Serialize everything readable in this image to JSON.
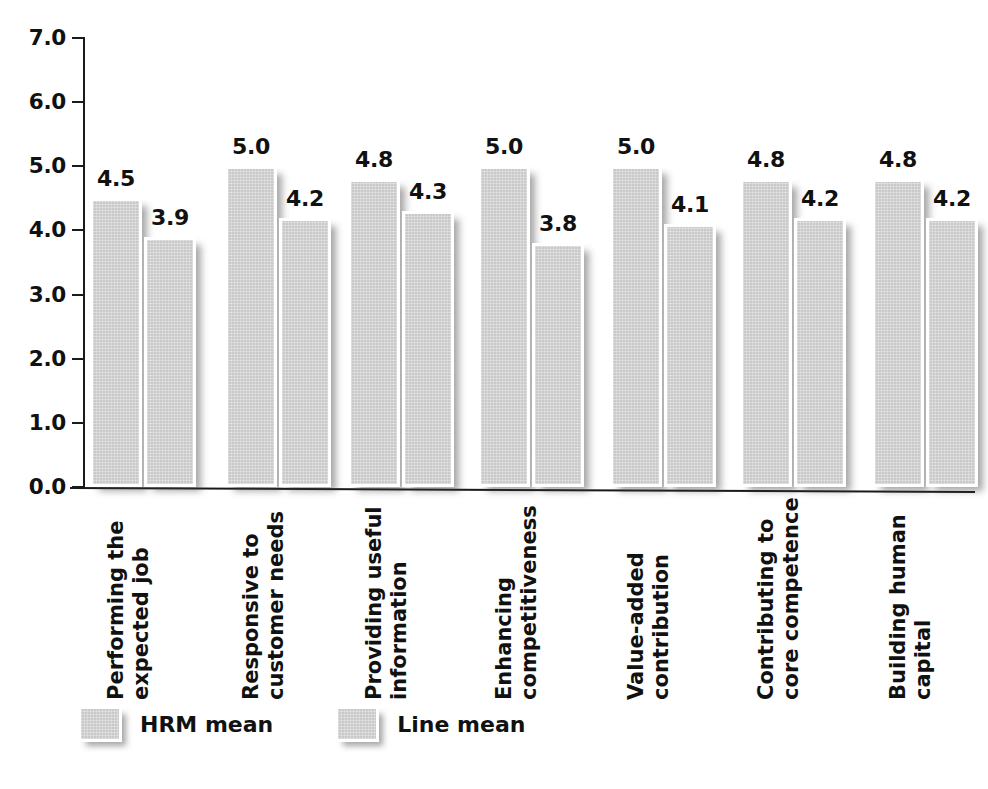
{
  "chart_data": {
    "type": "bar",
    "title": "",
    "subtitle": "",
    "xlabel": "",
    "ylabel": "",
    "ylim": [
      0.0,
      7.0
    ],
    "y_ticks": [
      "0.0",
      "1.0",
      "2.0",
      "3.0",
      "4.0",
      "5.0",
      "6.0",
      "7.0"
    ],
    "grid": false,
    "legend_position": "bottom-left",
    "categories": [
      "Performing the expected job",
      "Responsive to customer needs",
      "Providing useful information",
      "Enhancing competitiveness",
      "Value-added contribution",
      "Contributing to core competence",
      "Building human capital"
    ],
    "category_lines": [
      [
        "Performing the",
        "expected job"
      ],
      [
        "Responsive to",
        "customer needs"
      ],
      [
        "Providing useful",
        "information"
      ],
      [
        "Enhancing",
        "competitiveness"
      ],
      [
        "Value-added",
        "contribution"
      ],
      [
        "Contributing to",
        "core competence"
      ],
      [
        "Building human",
        "capital"
      ]
    ],
    "series": [
      {
        "name": "HRM mean",
        "color": "#c9c9c9",
        "values": [
          4.5,
          5.0,
          4.8,
          5.0,
          5.0,
          4.8,
          4.8
        ],
        "labels": [
          "4.5",
          "5.0",
          "4.8",
          "5.0",
          "5.0",
          "4.8",
          "4.8"
        ]
      },
      {
        "name": "Line mean",
        "color": "#c9c9c9",
        "values": [
          3.9,
          4.2,
          4.3,
          3.8,
          4.1,
          4.2,
          4.2
        ],
        "labels": [
          "3.9",
          "4.2",
          "4.3",
          "3.8",
          "4.1",
          "4.2",
          "4.2"
        ]
      }
    ]
  },
  "legend": {
    "items": [
      {
        "label": "HRM mean",
        "swatch": "gray-swatch"
      },
      {
        "label": "Line mean",
        "swatch": "gray-swatch"
      }
    ]
  },
  "colors": {
    "bar_fill": "#c9c9c9",
    "bar_border": "#ffffff",
    "axis": "#1a1a1a",
    "text": "#111111",
    "background": "#ffffff"
  }
}
